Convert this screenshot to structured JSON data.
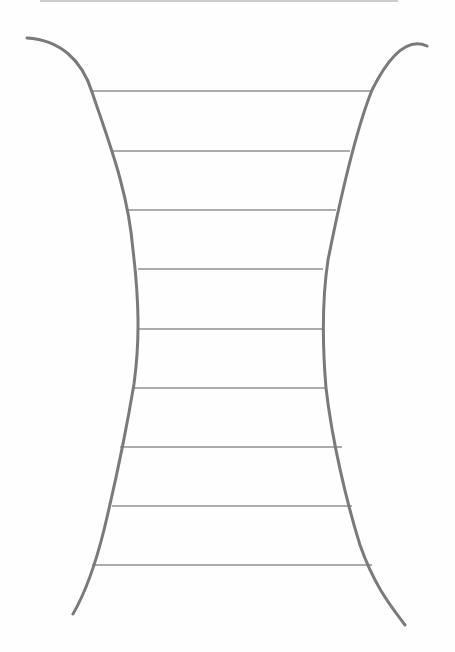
{
  "drawing": {
    "description": "Hand-drawn pencil sketch of a concave-sided hourglass / funnel shape with nine horizontal rungs",
    "colors": {
      "background": "#fefefe",
      "outline_stroke": "#7a7a7a",
      "rung_stroke": "#5a5a5a",
      "top_rule": "#9a9a9a"
    },
    "top_rule": {
      "x1": 40,
      "y1": 1,
      "x2": 398,
      "y2": 1
    },
    "left_outline_path": "M27 38 C 60 40, 82 60, 92 92 C 108 140, 128 190, 133 250 C 139 300, 140 340, 134 384 C 128 420, 116 480, 104 530 C 94 570, 84 595, 73 614",
    "right_outline_path": "M427 46 C 410 38, 392 50, 372 90 C 356 130, 340 200, 328 260 C 322 300, 322 340, 326 388 C 332 440, 346 500, 360 545 C 374 585, 390 605, 405 625",
    "rungs": [
      {
        "y": 91,
        "x1": 90,
        "x2": 371
      },
      {
        "y": 151,
        "x1": 112,
        "x2": 350
      },
      {
        "y": 210,
        "x1": 127,
        "x2": 336
      },
      {
        "y": 269,
        "x1": 138,
        "x2": 323
      },
      {
        "y": 329,
        "x1": 138,
        "x2": 323
      },
      {
        "y": 388,
        "x1": 134,
        "x2": 326
      },
      {
        "y": 447,
        "x1": 120,
        "x2": 342
      },
      {
        "y": 506,
        "x1": 112,
        "x2": 352
      },
      {
        "y": 565,
        "x1": 92,
        "x2": 372
      }
    ]
  }
}
